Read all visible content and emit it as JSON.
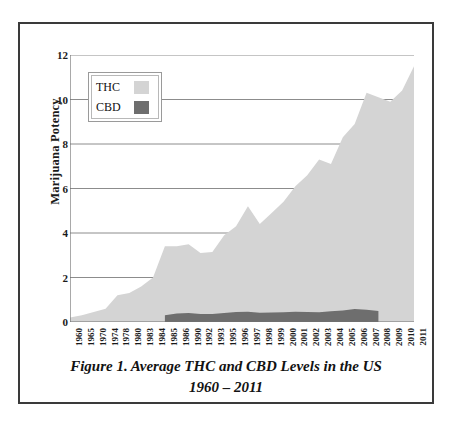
{
  "figure": {
    "caption_line1": "Figure 1. Average THC and CBD Levels in the US",
    "caption_line2": "1960 – 2011"
  },
  "legend": {
    "position": "inside-top-left",
    "items": [
      {
        "label": "THC",
        "color": "#d4d4d4",
        "name": "thc"
      },
      {
        "label": "CBD",
        "color": "#6e6e6e",
        "name": "cbd"
      }
    ]
  },
  "colors": {
    "thc_fill": "#d4d4d4",
    "cbd_fill": "#6e6e6e",
    "gridline": "#8c8c8c",
    "axis": "#707070",
    "frame": "#3a3a3a",
    "text": "#1a1a1a",
    "background": "#ffffff"
  },
  "chart_data": {
    "type": "area",
    "title": "Figure 1. Average THC and CBD Levels in the US 1960 – 2011",
    "xlabel": "",
    "ylabel": "Marijuana Potency",
    "ylim": [
      0,
      12
    ],
    "yticks": [
      0,
      2,
      4,
      6,
      8,
      10,
      12
    ],
    "grid": true,
    "grid_axis": "y",
    "legend_position": "upper left",
    "categories": [
      "1960",
      "1965",
      "1970",
      "1974",
      "1978",
      "1980",
      "1983",
      "1984",
      "1985",
      "1986",
      "1990",
      "1992",
      "1993",
      "1995",
      "1996",
      "1997",
      "1998",
      "1999",
      "2000",
      "2001",
      "2002",
      "2003",
      "2004",
      "2005",
      "2006",
      "2007",
      "2008",
      "2009",
      "2010",
      "2011"
    ],
    "series": [
      {
        "name": "THC",
        "color": "#d4d4d4",
        "values": [
          0.2,
          0.3,
          0.45,
          0.6,
          1.2,
          1.3,
          1.6,
          2.0,
          3.4,
          3.4,
          3.5,
          3.1,
          3.15,
          3.9,
          4.3,
          5.2,
          4.4,
          4.9,
          5.4,
          6.1,
          6.6,
          7.3,
          7.1,
          8.3,
          8.9,
          10.3,
          10.1,
          9.9,
          10.4,
          11.5
        ]
      },
      {
        "name": "CBD",
        "color": "#6e6e6e",
        "values": [
          null,
          null,
          null,
          null,
          null,
          null,
          null,
          null,
          0.3,
          0.38,
          0.4,
          0.36,
          0.36,
          0.41,
          0.45,
          0.46,
          0.42,
          0.43,
          0.44,
          0.46,
          0.45,
          0.44,
          0.48,
          0.52,
          0.58,
          0.55,
          0.5,
          null,
          null,
          null
        ]
      }
    ]
  }
}
